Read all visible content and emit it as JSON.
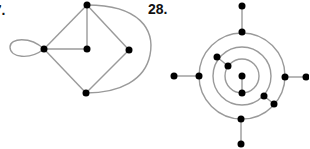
{
  "figures": [
    {
      "label": "27.",
      "description": "Graph with 5 vertices, a loop, and a curved edge",
      "vertices": 5,
      "edges": 8
    },
    {
      "label": "28.",
      "description": "Three concentric circles with vertices on them and pendant edges",
      "vertices": 14
    }
  ],
  "colors": {
    "edge": "#9a9a9a",
    "vertex": "#000000",
    "background": "#ffffff"
  }
}
